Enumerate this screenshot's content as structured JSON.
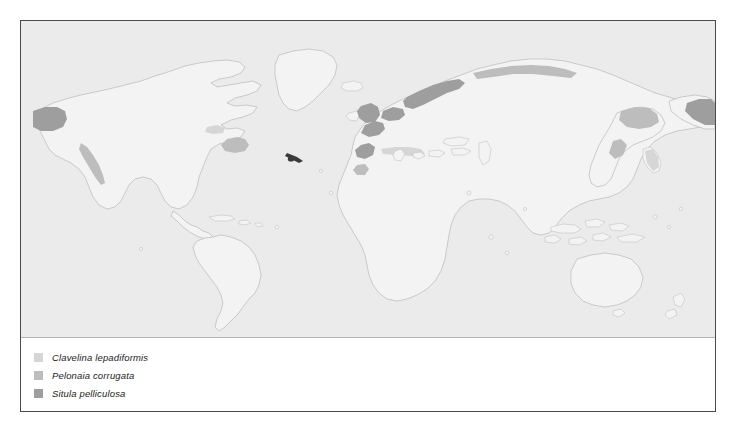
{
  "figure": {
    "type": "species-distribution-world-map",
    "map": {
      "ocean_color": "#ebebeb",
      "land_color": "#f3f3f3",
      "coastline_color": "#b9b9b9",
      "projection_note": "world map, Atlantic at left, Pacific at right"
    },
    "frame": {
      "border_color": "#4a4a4a",
      "background_color": "#ffffff"
    },
    "divider_color": "#b4b4b4"
  },
  "legend": {
    "items": [
      {
        "label": "Clavelina lepadiformis",
        "swatch_color": "#d6d6d6"
      },
      {
        "label": "Pelonaia corrugata",
        "swatch_color": "#bdbdbd"
      },
      {
        "label": "Situla pelliculosa",
        "swatch_color": "#9e9e9e"
      }
    ]
  },
  "distribution_regions": [
    {
      "name": "Northwest Europe / North Sea / Norwegian coast",
      "shade": "dark"
    },
    {
      "name": "Iberian and Northwest African Atlantic coast",
      "shade": "dark"
    },
    {
      "name": "British Isles and Irish Sea",
      "shade": "dark"
    },
    {
      "name": "Mediterranean Sea coast",
      "shade": "light"
    },
    {
      "name": "Alaska and Bering Sea",
      "shade": "dark"
    },
    {
      "name": "Aleutian Islands (right edge wrap)",
      "shade": "dark"
    },
    {
      "name": "Pacific Northwest of North America",
      "shade": "mid"
    },
    {
      "name": "Northeast North America / Gulf of St Lawrence",
      "shade": "mid"
    },
    {
      "name": "Kamchatka and Sea of Okhotsk",
      "shade": "mid"
    },
    {
      "name": "Japan and Korean coast",
      "shade": "light"
    },
    {
      "name": "Caribbean / western Atlantic point record",
      "shade": "point"
    }
  ]
}
